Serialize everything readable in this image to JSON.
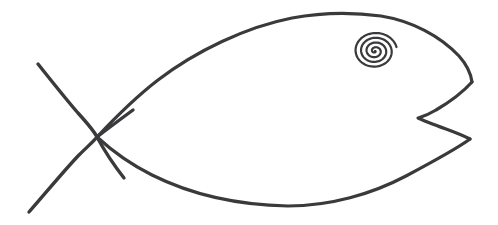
{
  "canvas": {
    "width": 498,
    "height": 225,
    "background_color": "#ffffff",
    "title": "Hand-drawn fish (ichthys) line drawing"
  },
  "style": {
    "ink_color": "#3a3a3c",
    "body_stroke_width": 3.2,
    "tail_stroke_width": 3.4,
    "eye_stroke_width": 2.2
  },
  "figure": {
    "name": "fish",
    "parts": [
      {
        "name": "body-upper-curve",
        "label": "Upper body outline",
        "path": "M 97 137 C 112 121 132 100 158 80 C 196 51 246 27 292 18 C 324 12 352 12 381 16 C 412 21 440 36 459 56 C 467 65 471 74 472 82"
      },
      {
        "name": "body-lower-curve",
        "label": "Lower body outline",
        "path": "M 97 137 C 110 149 128 163 152 175 C 190 194 238 205 288 206 C 330 206 372 194 406 176 C 436 160 458 148 470 139"
      },
      {
        "name": "tail-fin-notch",
        "label": "Rear tail fin notch",
        "path": "M 472 82 C 463 92 448 103 436 110 C 428 115 421 117 418 118 C 424 121 435 125 446 129 C 457 133 466 137 470 139"
      },
      {
        "name": "tail-stroke-upper",
        "label": "Upper crossing tail stroke",
        "path": "M 38 64 C 50 79 65 98 78 113 C 88 124 94 131 97 137 C 104 150 113 164 124 178"
      },
      {
        "name": "tail-stroke-lower",
        "label": "Lower crossing tail stroke",
        "path": "M 29 212 C 44 195 62 173 78 156 C 88 146 94 141 97 137 C 106 130 118 121 133 110"
      }
    ],
    "eye": {
      "name": "eye-spiral",
      "label": "Spiral eye",
      "center_x": 375,
      "center_y": 51,
      "radius_x": 22,
      "radius_y": 19,
      "turns": 4,
      "rotation_deg": -12
    }
  }
}
